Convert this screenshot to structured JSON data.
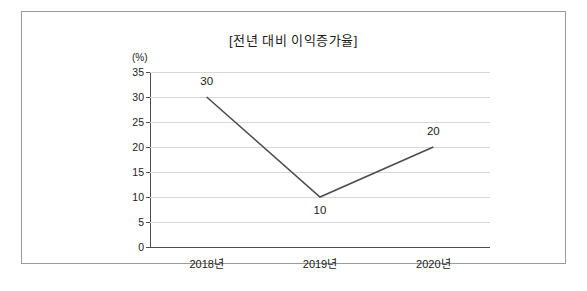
{
  "chart_data": {
    "type": "line",
    "title": "[전년 대비 이익증가율]",
    "xlabel": "",
    "ylabel": "(%)",
    "categories": [
      "2018년",
      "2019년",
      "2020년"
    ],
    "values": [
      30,
      10,
      20
    ],
    "point_labels": [
      "30",
      "10",
      "20"
    ],
    "yticks": [
      "0",
      "5",
      "10",
      "15",
      "20",
      "25",
      "30",
      "35"
    ],
    "ylim": [
      0,
      35
    ],
    "grid": true,
    "legend": "none",
    "line_color": "#4d4d4d"
  }
}
